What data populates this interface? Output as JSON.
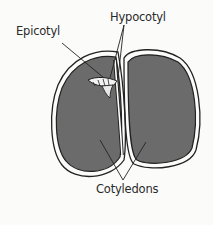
{
  "diagram": {
    "labels": {
      "epicotyl": "Epicotyl",
      "hypocotyl": "Hypocotyl",
      "cotyledons": "Cotyledons"
    },
    "colors": {
      "background": "#fbfbfa",
      "cotyledon_fill": "#6b6b6b",
      "outline": "#222222",
      "seed_coat_gap": "#ffffff",
      "label_text": "#2a2a2a"
    }
  }
}
